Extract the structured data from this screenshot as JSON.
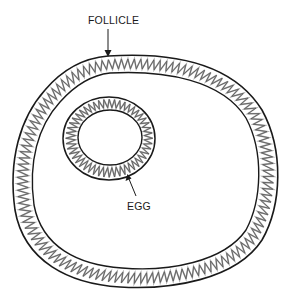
{
  "diagram": {
    "type": "biology-schematic",
    "labels": {
      "follicle": "FOLLICLE",
      "egg": "EGG"
    },
    "structures": [
      {
        "name": "follicle",
        "description": "Large oval outer ring with zigzag (granulosa) layer between two walls"
      },
      {
        "name": "egg",
        "description": "Small oval ring inside follicle, upper-left, with zigzag layer"
      }
    ],
    "colors": {
      "outline": "#1a1a1a",
      "zigzag_dark": "#555555",
      "zigzag_light": "#aaaaaa",
      "background": "#ffffff"
    }
  }
}
